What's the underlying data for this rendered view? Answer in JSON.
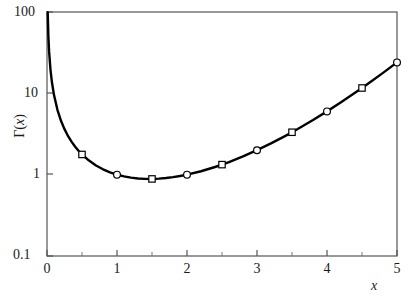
{
  "chart_data": {
    "type": "line",
    "title": "",
    "subtitle": "",
    "xlabel": "x",
    "ylabel": "Γ(x)",
    "xscale": "linear",
    "yscale": "log",
    "xlim": [
      0,
      5
    ],
    "ylim": [
      0.1,
      100
    ],
    "grid": false,
    "legend": null,
    "x_ticks": [
      "0",
      "1",
      "2",
      "3",
      "4",
      "5"
    ],
    "x_tick_values": [
      0,
      1,
      2,
      3,
      4,
      5
    ],
    "x_minor_ticks": [
      0.5,
      1.5,
      2.5,
      3.5,
      4.5
    ],
    "y_ticks": [
      "0.1",
      "1",
      "10",
      "100"
    ],
    "y_tick_values": [
      0.1,
      1,
      10,
      100
    ],
    "series": [
      {
        "name": "Γ(x)",
        "marker_pattern": [
          "square",
          "circle"
        ],
        "line_color": "#000000",
        "marker_fill": "#ffffff",
        "marker_edge": "#000000",
        "x": [
          0.01,
          0.02,
          0.03,
          0.05,
          0.07,
          0.1,
          0.15,
          0.2,
          0.25,
          0.3,
          0.35,
          0.4,
          0.45,
          0.5,
          0.6,
          0.7,
          0.8,
          0.9,
          1.0,
          1.1,
          1.2,
          1.3,
          1.4,
          1.5,
          1.6,
          1.7,
          1.8,
          1.9,
          2.0,
          2.2,
          2.4,
          2.5,
          2.6,
          2.8,
          3.0,
          3.2,
          3.4,
          3.5,
          3.6,
          3.8,
          4.0,
          4.2,
          4.4,
          4.5,
          4.6,
          4.8,
          5.0
        ],
        "y": [
          99.43,
          49.44,
          32.78,
          19.47,
          13.77,
          9.514,
          6.221,
          4.591,
          3.626,
          2.992,
          2.546,
          2.218,
          1.968,
          1.772,
          1.489,
          1.298,
          1.164,
          1.069,
          1.0,
          0.9514,
          0.9182,
          0.8975,
          0.8873,
          0.8862,
          0.8935,
          0.9086,
          0.9314,
          0.9618,
          1.0,
          1.102,
          1.242,
          1.329,
          1.43,
          1.676,
          2.0,
          2.424,
          2.981,
          3.323,
          3.717,
          4.694,
          6.0,
          7.757,
          10.14,
          11.63,
          13.38,
          17.84,
          24.0
        ],
        "markers": [
          {
            "x": 0.5,
            "y": 1.772,
            "shape": "square"
          },
          {
            "x": 1.0,
            "y": 1.0,
            "shape": "circle"
          },
          {
            "x": 1.5,
            "y": 0.8862,
            "shape": "square"
          },
          {
            "x": 2.0,
            "y": 1.0,
            "shape": "circle"
          },
          {
            "x": 2.5,
            "y": 1.329,
            "shape": "square"
          },
          {
            "x": 3.0,
            "y": 2.0,
            "shape": "circle"
          },
          {
            "x": 3.5,
            "y": 3.323,
            "shape": "square"
          },
          {
            "x": 4.0,
            "y": 6.0,
            "shape": "circle"
          },
          {
            "x": 4.5,
            "y": 11.63,
            "shape": "square"
          },
          {
            "x": 5.0,
            "y": 24.0,
            "shape": "circle"
          }
        ]
      }
    ]
  },
  "axes": {
    "x_tick_labels": {
      "t0": "0",
      "t1": "1",
      "t2": "2",
      "t3": "3",
      "t4": "4",
      "t5": "5"
    },
    "y_tick_labels": {
      "t100": "100",
      "t10": "10",
      "t1": "1",
      "t01": "0.1"
    },
    "x_title": "x",
    "y_title_gamma": "Γ(",
    "y_title_var": "x",
    "y_title_close": ")"
  }
}
